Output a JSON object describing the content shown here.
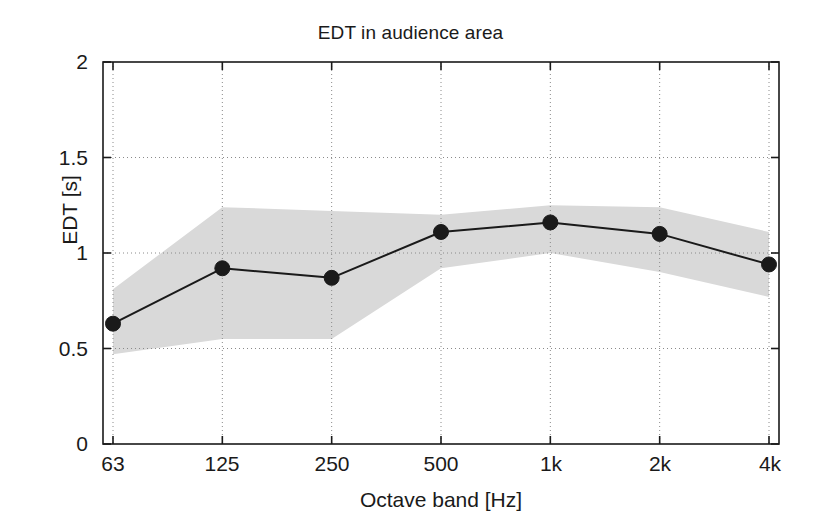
{
  "chart_data": {
    "type": "line",
    "title": "EDT in audience area",
    "xlabel": "Octave band [Hz]",
    "ylabel": "EDT [s]",
    "categories": [
      "63",
      "125",
      "250",
      "500",
      "1k",
      "2k",
      "4k"
    ],
    "xtick_labels": [
      "63",
      "125",
      "250",
      "500",
      "1k",
      "2k",
      "4k"
    ],
    "ytick_labels": [
      "0",
      "0.5",
      "1",
      "1.5",
      "2"
    ],
    "ytick_values": [
      0,
      0.5,
      1,
      1.5,
      2
    ],
    "ylim": [
      0,
      2
    ],
    "grid": true,
    "grid_style": "dotted",
    "legend": "none",
    "series": [
      {
        "name": "EDT mean",
        "style": "line-with-filled-circle-markers",
        "color": "#1a1a1a",
        "values": [
          0.63,
          0.92,
          0.87,
          1.11,
          1.16,
          1.1,
          0.94
        ]
      },
      {
        "name": "EDT spread upper bound",
        "style": "shaded-band-edge",
        "color": "#d9d9d9",
        "values": [
          0.81,
          1.24,
          1.22,
          1.2,
          1.25,
          1.24,
          1.11
        ]
      },
      {
        "name": "EDT spread lower bound",
        "style": "shaded-band-edge",
        "color": "#d9d9d9",
        "values": [
          0.47,
          0.55,
          0.55,
          0.92,
          1.0,
          0.9,
          0.77
        ]
      }
    ],
    "band_fill_color": "#d9d9d9",
    "axis_color": "#1a1a1a",
    "background_color": "#ffffff"
  }
}
